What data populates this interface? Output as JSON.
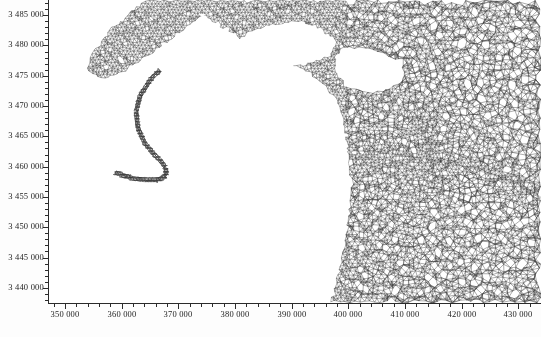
{
  "figure": {
    "kind": "finite-element-mesh-map",
    "background_color": "#ffffff",
    "mesh_color": "#3a3a3a",
    "axis_color": "#2b2b2b",
    "land_color": "#ffffff",
    "width_px": 541,
    "height_px": 337
  },
  "chart_data": {
    "type": "mesh-map",
    "title": "",
    "xlabel": "",
    "ylabel": "",
    "xlim": [
      347000,
      434000
    ],
    "ylim": [
      3437500,
      3487500
    ],
    "x_ticks": [
      350000,
      360000,
      370000,
      380000,
      390000,
      400000,
      410000,
      420000,
      430000
    ],
    "x_tick_labels": [
      "350 000",
      "360 000",
      "370 000",
      "380 000",
      "390 000",
      "400 000",
      "410 000",
      "420 000",
      "430 000"
    ],
    "y_ticks": [
      3440000,
      3445000,
      3450000,
      3455000,
      3460000,
      3465000,
      3470000,
      3475000,
      3480000,
      3485000
    ],
    "y_tick_labels": [
      "3 440 000",
      "3 445 000",
      "3 450 000",
      "3 455 000",
      "3 460 000",
      "3 465 000",
      "3 470 000",
      "3 475 000",
      "3 480 000",
      "3 485 000"
    ],
    "x_minor_interval": 2000,
    "y_minor_interval": 1000,
    "grid": false,
    "legend": null,
    "annotations": []
  },
  "axis_labels": {
    "x": [
      "350 000",
      "360 000",
      "370 000",
      "380 000",
      "390 000",
      "400 000",
      "410 000",
      "420 000",
      "430 000"
    ],
    "y": [
      "3 485 000",
      "3 480 000",
      "3 475 000",
      "3 470 000",
      "3 465 000",
      "3 460 000",
      "3 455 000",
      "3 450 000",
      "3 445 000",
      "3 440 000"
    ]
  }
}
